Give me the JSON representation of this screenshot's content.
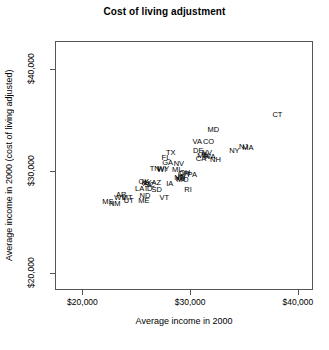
{
  "chart_data": {
    "type": "scatter",
    "title": "Cost of living adjustment",
    "xlabel": "Average income in 2000",
    "ylabel": "Average income in 2000 (cost of living adjusted)",
    "xlim": [
      17450,
      41400
    ],
    "ylim": [
      18300,
      42800
    ],
    "xticks": [
      20000,
      30000,
      40000
    ],
    "xtick_labels": [
      "$20,000",
      "$30,000",
      "$40,000"
    ],
    "yticks": [
      20000,
      30000,
      40000
    ],
    "ytick_labels": [
      "$20,000",
      "$30,000",
      "$40,000"
    ],
    "grid": false,
    "legend": "none",
    "marker": "text-label",
    "points": [
      {
        "label": "CT",
        "x": 38100,
        "y": 35550
      },
      {
        "label": "MD",
        "x": 32150,
        "y": 34050
      },
      {
        "label": "VA",
        "x": 30650,
        "y": 32850
      },
      {
        "label": "CO",
        "x": 31700,
        "y": 32850
      },
      {
        "label": "NJ",
        "x": 34950,
        "y": 32400
      },
      {
        "label": "MA",
        "x": 35350,
        "y": 32300
      },
      {
        "label": "NY",
        "x": 34100,
        "y": 32000
      },
      {
        "label": "DE",
        "x": 30750,
        "y": 32000
      },
      {
        "label": "NV",
        "x": 31550,
        "y": 31750
      },
      {
        "label": "IL",
        "x": 31400,
        "y": 31600
      },
      {
        "label": "MN",
        "x": 31200,
        "y": 31500
      },
      {
        "label": "WA",
        "x": 31800,
        "y": 31400
      },
      {
        "label": "NH",
        "x": 32350,
        "y": 31050
      },
      {
        "label": "CA",
        "x": 31000,
        "y": 31200
      },
      {
        "label": "TX",
        "x": 28200,
        "y": 31750
      },
      {
        "label": "FL",
        "x": 27750,
        "y": 31250
      },
      {
        "label": "GA",
        "x": 27900,
        "y": 30750
      },
      {
        "label": "NV",
        "x": 28950,
        "y": 30700
      },
      {
        "label": "WY",
        "x": 27500,
        "y": 30200
      },
      {
        "label": "MI",
        "x": 28700,
        "y": 30150
      },
      {
        "label": "TN",
        "x": 26700,
        "y": 30250
      },
      {
        "label": "WI",
        "x": 27350,
        "y": 30150
      },
      {
        "label": "OH",
        "x": 29500,
        "y": 29800
      },
      {
        "label": "OR",
        "x": 29400,
        "y": 29700
      },
      {
        "label": "PA",
        "x": 30200,
        "y": 29600
      },
      {
        "label": "IN",
        "x": 29200,
        "y": 29400
      },
      {
        "label": "NE",
        "x": 29000,
        "y": 29350
      },
      {
        "label": "KS",
        "x": 29100,
        "y": 29200
      },
      {
        "label": "MO",
        "x": 29300,
        "y": 29100
      },
      {
        "label": "RI",
        "x": 29800,
        "y": 28100
      },
      {
        "label": "KY",
        "x": 25950,
        "y": 28850
      },
      {
        "label": "AL",
        "x": 26050,
        "y": 28750
      },
      {
        "label": "SC",
        "x": 26250,
        "y": 28650
      },
      {
        "label": "OK",
        "x": 25700,
        "y": 28950
      },
      {
        "label": "AZ",
        "x": 26850,
        "y": 28800
      },
      {
        "label": "IA",
        "x": 28100,
        "y": 28750
      },
      {
        "label": "LA",
        "x": 25300,
        "y": 28250
      },
      {
        "label": "ID",
        "x": 26150,
        "y": 28250
      },
      {
        "label": "SD",
        "x": 26900,
        "y": 28150
      },
      {
        "label": "ND",
        "x": 25800,
        "y": 27500
      },
      {
        "label": "VT",
        "x": 27600,
        "y": 27400
      },
      {
        "label": "AR",
        "x": 23600,
        "y": 27650
      },
      {
        "label": "WV",
        "x": 23500,
        "y": 27400
      },
      {
        "label": "MT",
        "x": 24150,
        "y": 27350
      },
      {
        "label": "UT",
        "x": 24300,
        "y": 27050
      },
      {
        "label": "ME",
        "x": 25700,
        "y": 27050
      },
      {
        "label": "MS",
        "x": 22350,
        "y": 26950
      },
      {
        "label": "NM",
        "x": 23000,
        "y": 26750
      }
    ]
  }
}
